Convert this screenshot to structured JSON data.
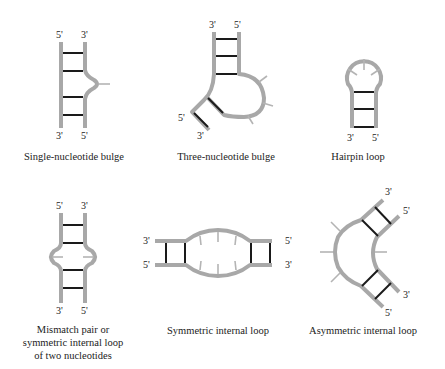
{
  "figure": {
    "panels": [
      {
        "id": "single-nucleotide-bulge",
        "caption": "Single-nucleotide bulge",
        "end_labels": {
          "top_left": "5'",
          "top_right": "3'",
          "bottom_left": "3'",
          "bottom_right": "5'"
        },
        "base_pairs": 4,
        "unpaired_nucleotides": 1
      },
      {
        "id": "three-nucleotide-bulge",
        "caption": "Three-nucleotide bulge",
        "end_labels": {
          "top_left": "3'",
          "top_right": "5'",
          "lower_left": "5'",
          "lower_bottom": "3'"
        },
        "base_pairs": 5,
        "unpaired_nucleotides": 3
      },
      {
        "id": "hairpin-loop",
        "caption": "Hairpin loop",
        "end_labels": {
          "bottom_left": "3'",
          "bottom_right": "5'"
        },
        "base_pairs": 3,
        "unpaired_nucleotides": 3
      },
      {
        "id": "mismatch-pair",
        "caption_lines": [
          "Mismatch pair or",
          "symmetric internal loop",
          "of two nucleotides"
        ],
        "end_labels": {
          "top_left": "5'",
          "top_right": "3'",
          "bottom_left": "3'",
          "bottom_right": "5'"
        },
        "base_pairs": 4,
        "unpaired_nucleotides": 2
      },
      {
        "id": "symmetric-internal-loop",
        "caption": "Symmetric internal loop",
        "end_labels": {
          "left_top": "3'",
          "left_bottom": "5'",
          "right_top": "5'",
          "right_bottom": "3'"
        },
        "base_pairs": 4,
        "unpaired_nucleotides": 6
      },
      {
        "id": "asymmetric-internal-loop",
        "caption": "Asymmetric internal loop",
        "end_labels": {
          "upper_outer": "3'",
          "upper_inner": "5'",
          "lower_inner": "3'",
          "lower_outer": "5'"
        },
        "base_pairs": 4,
        "unpaired_nucleotides": 4
      }
    ],
    "colors": {
      "strand": "#a8a8a8",
      "base_pair": "#1a1a1a",
      "unpaired_tick": "#b4b4b4",
      "text": "#222222"
    }
  }
}
